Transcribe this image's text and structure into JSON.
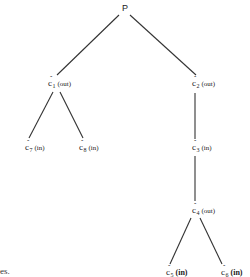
{
  "diagram": {
    "type": "tree",
    "root": {
      "label": "P"
    },
    "nodes": [
      {
        "id": "c1",
        "symbol": "c",
        "accent": "ˆ",
        "subscript": "1",
        "status": "(out)",
        "bold": false
      },
      {
        "id": "c2",
        "symbol": "c",
        "accent": "ˆ",
        "subscript": "2",
        "status": "(out)",
        "bold": false
      },
      {
        "id": "c7",
        "symbol": "c",
        "accent": "ˆ",
        "subscript": "7",
        "status": "(in)",
        "bold": false
      },
      {
        "id": "c8",
        "symbol": "c",
        "accent": "ˆ",
        "subscript": "8",
        "status": "(in)",
        "bold": false
      },
      {
        "id": "c3",
        "symbol": "c",
        "accent": "ˆ",
        "subscript": "3",
        "status": "(in)",
        "bold": false
      },
      {
        "id": "c4",
        "symbol": "c",
        "accent": "ˆ",
        "subscript": "4",
        "status": "(out)",
        "bold": false
      },
      {
        "id": "c5",
        "symbol": "c",
        "accent": "ˆ",
        "subscript": "5",
        "status": "(in)",
        "bold": true
      },
      {
        "id": "c6",
        "symbol": "c",
        "accent": "ˆ",
        "subscript": "6",
        "status": "(in)",
        "bold": true
      }
    ],
    "edges": [
      [
        "P",
        "c1"
      ],
      [
        "P",
        "c2"
      ],
      [
        "c1",
        "c7"
      ],
      [
        "c1",
        "c8"
      ],
      [
        "c2",
        "c3"
      ],
      [
        "c3",
        "c4"
      ],
      [
        "c4",
        "c5"
      ],
      [
        "c4",
        "c6"
      ]
    ]
  },
  "caption_fragment": "es."
}
